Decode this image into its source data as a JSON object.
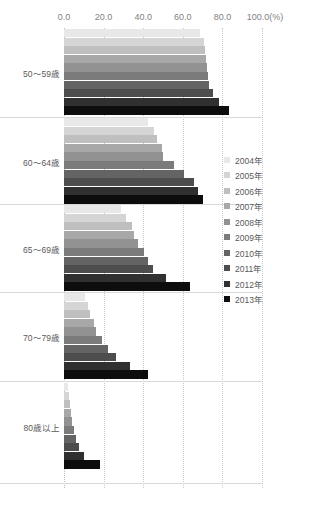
{
  "top_title": "",
  "source_note": "",
  "axis": {
    "unit_suffix": "(%)",
    "ticks": [
      "0.0",
      "20.0",
      "40.0",
      "60.0",
      "80.0",
      "100.0"
    ]
  },
  "legend": {
    "items": [
      {
        "label": "2004年",
        "color": "#e8e8e8"
      },
      {
        "label": "2005年",
        "color": "#d5d5d5"
      },
      {
        "label": "2006年",
        "color": "#bfbfbf"
      },
      {
        "label": "2007年",
        "color": "#a8a8a8"
      },
      {
        "label": "2008年",
        "color": "#929292"
      },
      {
        "label": "2009年",
        "color": "#7b7b7b"
      },
      {
        "label": "2010年",
        "color": "#646464"
      },
      {
        "label": "2011年",
        "color": "#4d4d4d"
      },
      {
        "label": "2012年",
        "color": "#303030"
      },
      {
        "label": "2013年",
        "color": "#0d0d0d"
      }
    ]
  },
  "chart_data": {
    "type": "bar",
    "orientation": "horizontal",
    "title": "",
    "xlabel": "(%)",
    "ylabel": "",
    "xlim": [
      0,
      100
    ],
    "grid": true,
    "legend_position": "right",
    "categories": [
      "50～59歳",
      "60～64歳",
      "65～69歳",
      "70～79歳",
      "80歳以上"
    ],
    "series": [
      {
        "name": "2004年",
        "color": "#e8e8e8",
        "values": [
          68.7,
          42.4,
          28.8,
          10.6,
          2.0
        ]
      },
      {
        "name": "2005年",
        "color": "#d5d5d5",
        "values": [
          70.7,
          45.5,
          31.3,
          12.1,
          2.5
        ]
      },
      {
        "name": "2006年",
        "color": "#bfbfbf",
        "values": [
          71.2,
          47.0,
          34.3,
          13.1,
          3.0
        ]
      },
      {
        "name": "2007年",
        "color": "#a8a8a8",
        "values": [
          71.7,
          49.5,
          35.4,
          15.2,
          3.5
        ]
      },
      {
        "name": "2008年",
        "color": "#929292",
        "values": [
          72.2,
          50.0,
          37.4,
          16.2,
          4.0
        ]
      },
      {
        "name": "2009年",
        "color": "#7b7b7b",
        "values": [
          72.7,
          55.6,
          40.4,
          19.2,
          5.1
        ]
      },
      {
        "name": "2010年",
        "color": "#646464",
        "values": [
          73.2,
          60.6,
          42.4,
          22.2,
          6.1
        ]
      },
      {
        "name": "2011年",
        "color": "#4d4d4d",
        "values": [
          75.3,
          65.7,
          44.9,
          26.3,
          7.6
        ]
      },
      {
        "name": "2012年",
        "color": "#303030",
        "values": [
          78.3,
          67.7,
          51.5,
          33.3,
          10.1
        ]
      },
      {
        "name": "2013年",
        "color": "#0d0d0d",
        "values": [
          83.3,
          70.2,
          63.6,
          42.4,
          18.2
        ]
      }
    ]
  },
  "layout": {
    "group_tops": [
      1,
      90,
      177,
      265,
      355
    ],
    "group_height": 87,
    "bar_slot": 8.6,
    "plot_width_px": 198,
    "separator_ys": [
      88.5,
      176,
      264,
      353,
      455
    ]
  }
}
